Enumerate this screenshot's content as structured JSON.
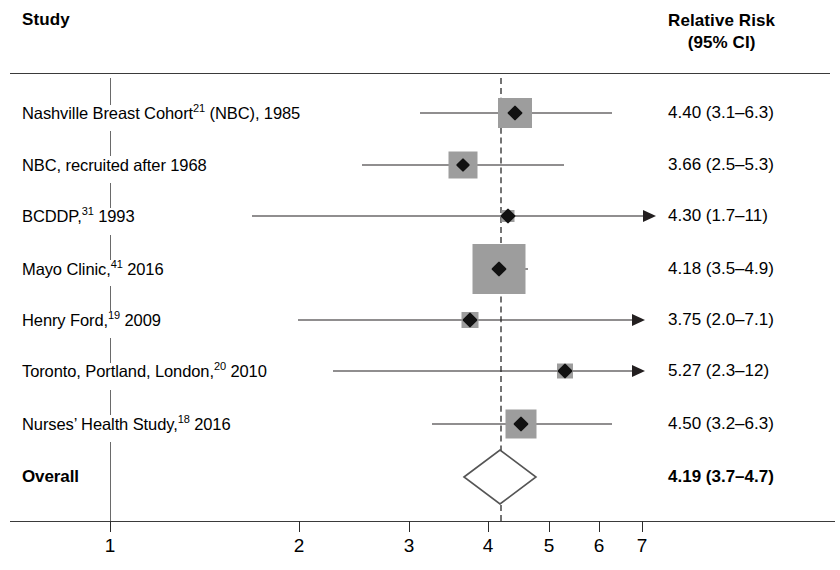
{
  "header": {
    "study_label": "Study",
    "rr_line1": "Relative Risk",
    "rr_line2": "(95% CI)"
  },
  "axis": {
    "type": "log",
    "ticks": [
      {
        "value": 1,
        "label": "1",
        "x": 110
      },
      {
        "value": 2,
        "label": "2",
        "x": 299
      },
      {
        "value": 3,
        "label": "3",
        "x": 409
      },
      {
        "value": 4,
        "label": "4",
        "x": 488
      },
      {
        "value": 5,
        "label": "5",
        "x": 549
      },
      {
        "value": 6,
        "label": "6",
        "x": 599
      },
      {
        "value": 7,
        "label": "7",
        "x": 642
      }
    ],
    "reference_line_value": 1,
    "null_line_x": 110,
    "pooled_dashed_line_value": 4.19,
    "pooled_dashed_line_x": 500
  },
  "chart_data": {
    "type": "forest",
    "title": "",
    "xlabel": "",
    "ylabel": "",
    "xscale": "log",
    "xlim": [
      1,
      7.6
    ],
    "grid": false,
    "legend": "none",
    "measure": "Relative Risk (95% CI)",
    "columns": [
      "Study",
      "Relative Risk (95% CI)"
    ],
    "rows": [
      {
        "study": "Nashville Breast Cohort",
        "ref": "21",
        "study_suffix": " (NBC), 1985",
        "estimate": 4.4,
        "ci_low": 3.1,
        "ci_high": 6.3,
        "value_text": "4.40 (3.1–6.3)",
        "truncated_right": false,
        "y": 113,
        "marker_x": 515,
        "box_w": 34,
        "box_h": 30,
        "whisker_x1": 420,
        "whisker_x2": 612,
        "diamond_size": 11
      },
      {
        "study": "NBC, recruited after 1968",
        "ref": "",
        "study_suffix": "",
        "estimate": 3.66,
        "ci_low": 2.5,
        "ci_high": 5.3,
        "value_text": "3.66 (2.5–5.3)",
        "truncated_right": false,
        "y": 165,
        "marker_x": 463,
        "box_w": 29,
        "box_h": 27,
        "whisker_x1": 362,
        "whisker_x2": 564,
        "diamond_size": 10
      },
      {
        "study": "BCDDP,",
        "ref": "31",
        "study_suffix": " 1993",
        "estimate": 4.3,
        "ci_low": 1.7,
        "ci_high": 11,
        "value_text": "4.30 (1.7–11)",
        "truncated_right": true,
        "y": 216,
        "marker_x": 508,
        "box_w": 13,
        "box_h": 12,
        "whisker_x1": 252,
        "whisker_x2": 643,
        "diamond_size": 11
      },
      {
        "study": "Mayo Clinic,",
        "ref": "41",
        "study_suffix": " 2016",
        "estimate": 4.18,
        "ci_low": 3.5,
        "ci_high": 4.9,
        "value_text": "4.18 (3.5–4.9)",
        "truncated_right": false,
        "y": 269,
        "marker_x": 499,
        "box_w": 53,
        "box_h": 50,
        "whisker_x1": 473,
        "whisker_x2": 528,
        "diamond_size": 11
      },
      {
        "study": "Henry Ford,",
        "ref": "19",
        "study_suffix": " 2009",
        "estimate": 3.75,
        "ci_low": 2.0,
        "ci_high": 7.1,
        "value_text": "3.75 (2.0–7.1)",
        "truncated_right": true,
        "y": 320,
        "marker_x": 470,
        "box_w": 17,
        "box_h": 16,
        "whisker_x1": 298,
        "whisker_x2": 632,
        "diamond_size": 11
      },
      {
        "study": "Toronto, Portland, London,",
        "ref": "20",
        "study_suffix": " 2010",
        "estimate": 5.27,
        "ci_low": 2.3,
        "ci_high": 12,
        "value_text": "5.27 (2.3–12)",
        "truncated_right": true,
        "y": 371,
        "marker_x": 565,
        "box_w": 16,
        "box_h": 15,
        "whisker_x1": 333,
        "whisker_x2": 632,
        "diamond_size": 11
      },
      {
        "study": "Nurses’ Health Study,",
        "ref": "18",
        "study_suffix": " 2016",
        "estimate": 4.5,
        "ci_low": 3.2,
        "ci_high": 6.3,
        "value_text": "4.50 (3.2–6.3)",
        "truncated_right": false,
        "y": 424,
        "marker_x": 521,
        "box_w": 31,
        "box_h": 29,
        "whisker_x1": 432,
        "whisker_x2": 612,
        "diamond_size": 11
      }
    ],
    "overall": {
      "label": "Overall",
      "estimate": 4.19,
      "ci_low": 3.7,
      "ci_high": 4.7,
      "value_text": "4.19 (3.7–4.7)",
      "y": 477,
      "center_x": 500,
      "left_x": 464,
      "right_x": 536,
      "half_height": 27
    }
  },
  "colors": {
    "box_gray": "#9d9d9d",
    "marker_black": "#111111",
    "rule_gray": "#3a3a3a",
    "dash_gray": "#737373",
    "background": "#ffffff"
  }
}
